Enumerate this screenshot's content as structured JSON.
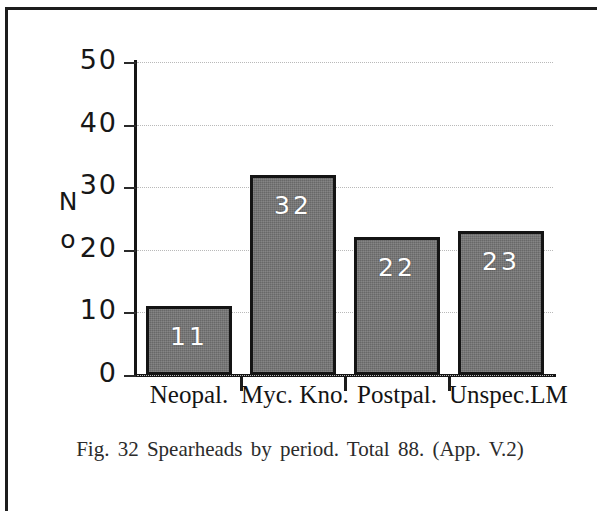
{
  "figure": {
    "caption": "Fig. 32  Spearheads by period.  Total 88. (App. V.2)"
  },
  "chart_data": {
    "type": "bar",
    "title": "",
    "subtitle": "",
    "xlabel": "",
    "ylabel": "No",
    "ylabel_lines": [
      "N",
      "o"
    ],
    "categories": [
      "Neopal.",
      "Myc. Kno.",
      "Postpal.",
      "Unspec.LM"
    ],
    "values": [
      11,
      32,
      22,
      23
    ],
    "value_labels": [
      "11",
      "32",
      "22",
      "23"
    ],
    "total": 88,
    "ylim": [
      0,
      50
    ],
    "yticks": [
      0,
      10,
      20,
      30,
      40,
      50
    ],
    "ytick_labels": [
      "0",
      "10",
      "20",
      "30",
      "40",
      "50"
    ],
    "grid": true,
    "grid_style": "dotted",
    "legend": false,
    "bar_fill_color": "#757575",
    "bar_border_color": "#141414",
    "value_label_color": "#ffffff",
    "axis_color": "#161616",
    "gridline_color": "#b9b9b9"
  }
}
